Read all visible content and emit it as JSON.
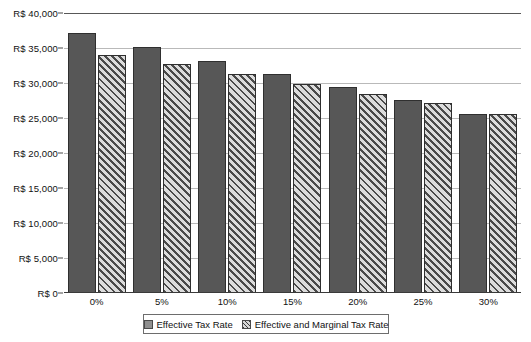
{
  "chart_data": {
    "type": "bar",
    "title": "",
    "xlabel": "",
    "ylabel": "",
    "categories": [
      "0%",
      "5%",
      "10%",
      "15%",
      "20%",
      "25%",
      "30%"
    ],
    "series": [
      {
        "name": "Effective Tax Rate",
        "style": "solid",
        "color": "#575757",
        "values": [
          37200,
          35200,
          33200,
          31300,
          29400,
          27600,
          25600
        ]
      },
      {
        "name": "Effective and Marginal Tax Rate",
        "style": "diagonal-hatch",
        "color": "#d8d8d8",
        "values": [
          34000,
          32700,
          31300,
          29900,
          28500,
          27100,
          25600
        ]
      }
    ],
    "ylim": [
      0,
      40000
    ],
    "ytick_values": [
      0,
      5000,
      10000,
      15000,
      20000,
      25000,
      30000,
      35000,
      40000
    ],
    "ytick_labels": [
      "R$ 0",
      "R$ 5,000",
      "R$ 10,000",
      "R$ 15,000",
      "R$ 20,000",
      "R$ 25,000",
      "R$ 30,000",
      "R$ 35,000",
      "R$ 40,000"
    ],
    "grid": true,
    "legend_position": "bottom"
  },
  "legend": {
    "items": [
      {
        "label": "Effective Tax Rate",
        "style": "solid"
      },
      {
        "label": "Effective and Marginal Tax Rate",
        "style": "hatched"
      }
    ]
  }
}
